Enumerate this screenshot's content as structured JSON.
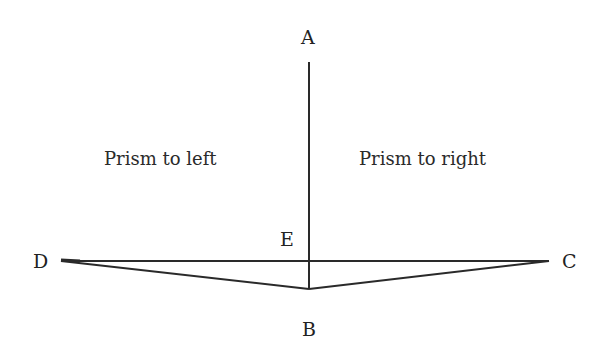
{
  "labels": {
    "A": "A",
    "B": "B",
    "C": "C",
    "D": "D",
    "E": "E"
  },
  "regions": {
    "left": "Prism to left",
    "right": "Prism to right"
  },
  "colors": {
    "line": "#2a2a2a",
    "text": "#222222",
    "background": "#ffffff"
  }
}
